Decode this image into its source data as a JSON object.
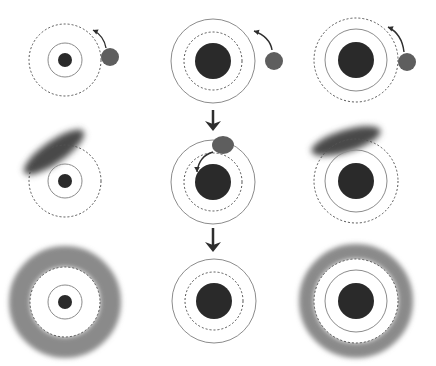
{
  "canvas": {
    "width": 436,
    "height": 366,
    "background": "#ffffff"
  },
  "colors": {
    "core": "#2a2a2a",
    "satellite": "#5e5e5e",
    "smudge": "#4a4a4a",
    "halo": "#8a8a8a",
    "solid_ring": "#8c8c8c",
    "dashed_ring": "#555555",
    "arrow": "#2e2e2e"
  },
  "panels": [
    {
      "id": "top-left",
      "cx": 65,
      "cy": 60,
      "core_r": 7,
      "solid_r": 17,
      "dashed_r": 36,
      "satellite": {
        "cx": 110,
        "cy": 57,
        "rx": 9,
        "ry": 9
      },
      "orbit_arrow": {
        "path": "M106,48 Q104,36 93,30",
        "tip": [
          93,
          30
        ],
        "dir": [
          -11,
          -5
        ]
      }
    },
    {
      "id": "top-middle",
      "cx": 213,
      "cy": 61,
      "core_r": 18,
      "solid_r": 42,
      "dashed_r": 29,
      "satellite": {
        "cx": 274,
        "cy": 61,
        "rx": 9,
        "ry": 9
      },
      "orbit_arrow": {
        "path": "M272,50 Q270,37 254,31",
        "tip": [
          254,
          31
        ],
        "dir": [
          -13,
          -4
        ]
      }
    },
    {
      "id": "top-right",
      "cx": 356,
      "cy": 60,
      "core_r": 18,
      "solid_r": 31,
      "dashed_r": 42,
      "satellite": {
        "cx": 407,
        "cy": 62,
        "rx": 9,
        "ry": 9
      },
      "orbit_arrow": {
        "path": "M404,52 Q402,34 388,27",
        "tip": [
          388,
          27
        ],
        "dir": [
          -12,
          -5
        ]
      }
    },
    {
      "id": "middle-left",
      "cx": 65,
      "cy": 181,
      "core_r": 7,
      "solid_r": 17,
      "dashed_r": 36,
      "smudge": {
        "cx": 54,
        "cy": 152,
        "rx": 36,
        "ry": 11,
        "angle": -35
      }
    },
    {
      "id": "middle-middle",
      "cx": 213,
      "cy": 182,
      "core_r": 18,
      "solid_r": 42,
      "dashed_r": 29,
      "satellite": {
        "cx": 223,
        "cy": 145,
        "rx": 11,
        "ry": 9
      },
      "infall_arrow": {
        "path": "M213,152 Q199,156 197,172",
        "tip": [
          197,
          172
        ],
        "dir": [
          0,
          8
        ]
      }
    },
    {
      "id": "middle-right",
      "cx": 356,
      "cy": 181,
      "core_r": 18,
      "solid_r": 31,
      "dashed_r": 42,
      "smudge": {
        "cx": 346,
        "cy": 141,
        "rx": 36,
        "ry": 11,
        "angle": -17
      }
    },
    {
      "id": "bottom-left",
      "cx": 65,
      "cy": 302,
      "core_r": 7,
      "solid_r": 17,
      "dashed_r": 35,
      "halo": {
        "inner_r": 35,
        "outer_r": 56
      }
    },
    {
      "id": "bottom-middle",
      "cx": 214,
      "cy": 301,
      "core_r": 18,
      "solid_r": 42,
      "dashed_r": 29
    },
    {
      "id": "bottom-right",
      "cx": 356,
      "cy": 301,
      "core_r": 18,
      "solid_r": 31,
      "dashed_r": 42,
      "halo": {
        "inner_r": 42,
        "outer_r": 57
      }
    }
  ],
  "step_arrows": [
    {
      "id": "step-arrow-1",
      "x": 213,
      "y1": 110,
      "y2": 131
    },
    {
      "id": "step-arrow-2",
      "x": 213,
      "y1": 228,
      "y2": 252
    }
  ]
}
